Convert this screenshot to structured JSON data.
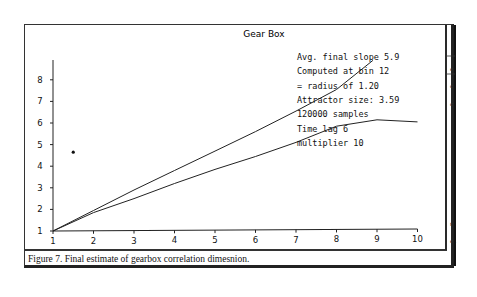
{
  "figure": {
    "caption": "Figure 7. Final estimate of gearbox correlation dimesnion."
  },
  "chart_data": {
    "type": "line",
    "title": "Gear Box",
    "xlabel": "",
    "ylabel": "",
    "xlim": [
      1,
      10
    ],
    "ylim": [
      1,
      9
    ],
    "x_ticks": [
      "1",
      "2",
      "3",
      "4",
      "5",
      "6",
      "7",
      "8",
      "9",
      "10"
    ],
    "y_ticks": [
      "1",
      "2",
      "3",
      "4",
      "5",
      "6",
      "7",
      "8"
    ],
    "grid": false,
    "legend": null,
    "series": [
      {
        "name": "upper line",
        "x": [
          1,
          2,
          3,
          4,
          5,
          6,
          7,
          8,
          8.9
        ],
        "y": [
          1,
          1.95,
          2.9,
          3.8,
          4.7,
          5.6,
          6.55,
          7.55,
          8.9
        ]
      },
      {
        "name": "lower curve",
        "x": [
          1,
          2,
          3,
          4,
          5,
          6,
          7,
          8,
          9,
          10
        ],
        "y": [
          1,
          1.85,
          2.5,
          3.2,
          3.85,
          4.45,
          5.1,
          5.85,
          6.15,
          6.05
        ]
      },
      {
        "name": "point",
        "type": "scatter",
        "x": [
          1.5
        ],
        "y": [
          4.65
        ]
      }
    ],
    "annotations": [
      "Avg. final slope 5.9",
      "Computed at bin 12",
      "  = radius of 1.20",
      "Attractor size: 3.59",
      "120000 samples",
      "Time lag 6",
      "multiplier 10"
    ]
  },
  "side_marks": [
    "e",
    "c",
    "c",
    "t",
    "e1"
  ]
}
